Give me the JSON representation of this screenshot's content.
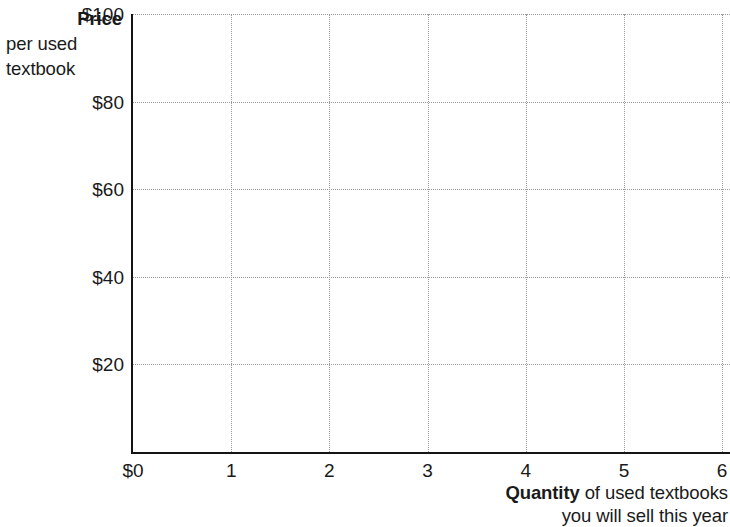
{
  "y_axis_caption": {
    "line1_bold": "Price",
    "line2": "per used",
    "line3": "textbook"
  },
  "x_axis_caption": {
    "bold": "Quantity",
    "rest": " of used textbooks",
    "line2": "you will sell this year"
  },
  "origin_label": "$0",
  "chart_data": {
    "type": "line",
    "title": "",
    "subtitle": "",
    "xlabel": "Quantity of used textbooks you will sell this year",
    "ylabel": "Price per used textbook",
    "xlim": [
      0,
      6.08
    ],
    "ylim": [
      0,
      100
    ],
    "x_ticks": [
      0,
      1,
      2,
      3,
      4,
      5,
      6
    ],
    "x_tick_labels": [
      "$0",
      "1",
      "2",
      "3",
      "4",
      "5",
      "6"
    ],
    "y_ticks": [
      0,
      20,
      40,
      60,
      80,
      100
    ],
    "y_tick_labels": [
      "$0",
      "$20",
      "$40",
      "$60",
      "$80",
      "$100"
    ],
    "grid": true,
    "grid_style": "dotted",
    "grid_color": "#9b9b9b",
    "axis_color": "#141414",
    "background_color": "#ffffff",
    "legend": null,
    "series": [],
    "annotations": [],
    "note": "Empty plotting grid with no data plotted"
  }
}
